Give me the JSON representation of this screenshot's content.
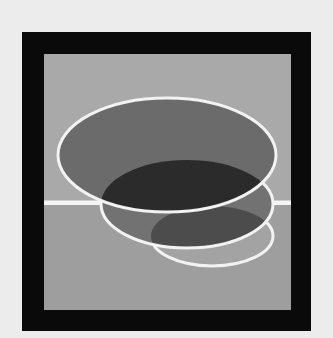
{
  "artwork": {
    "title": "Abstract composition: three overlapping ellipses over a horizon within a black frame",
    "colors": {
      "page_background": "#ececec",
      "frame": "#0a0a0a",
      "panel_upper": "#a9a9a9",
      "panel_lower": "#9e9e9e",
      "horizon_line": "#f4f4f4",
      "ellipse_large_fill": "#6b6b6b",
      "ellipse_middle_fill": "#727272",
      "ellipse_small_fill": "#a3a3a3",
      "overlap_dark": "#2b2b2b",
      "overlap_middle_small": "#4c4c4c",
      "outline": "#f2f2f2"
    },
    "frame": {
      "x": 22,
      "y": 32,
      "width": 289,
      "height": 299
    },
    "panel": {
      "x": 44,
      "y": 54,
      "width": 247,
      "height": 256
    },
    "horizon_y": 203,
    "ellipses": [
      {
        "name": "large",
        "cx": 167,
        "cy": 155,
        "rx": 109,
        "ry": 57
      },
      {
        "name": "middle",
        "cx": 187,
        "cy": 204,
        "rx": 86,
        "ry": 44
      },
      {
        "name": "small",
        "cx": 212,
        "cy": 236,
        "rx": 61,
        "ry": 30
      }
    ]
  }
}
